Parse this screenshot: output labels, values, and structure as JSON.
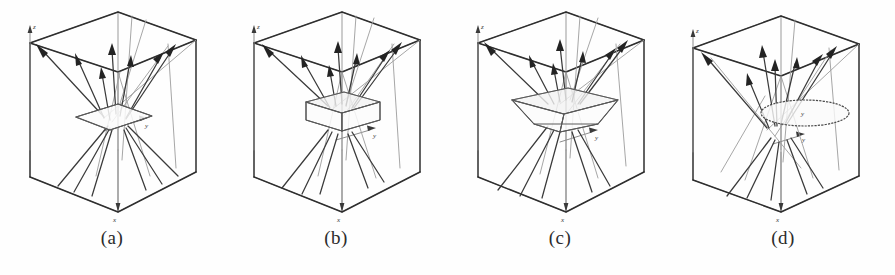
{
  "figure": {
    "background_color": "#fefefe",
    "ink_color": "#2e2e2e",
    "faint_ink_color": "#9a9a9a",
    "panel_count": 4
  },
  "axes": {
    "z_label": "z",
    "y_label": "y",
    "x_label": "x"
  },
  "panels": [
    {
      "id": "panel-a",
      "caption": "(a)",
      "scatterer": "flat-plane",
      "scatterer_name": "planar-sheet",
      "axis_z": "z",
      "axis_y": "y",
      "axis_x": "x"
    },
    {
      "id": "panel-b",
      "caption": "(b)",
      "scatterer": "rectangular-box",
      "scatterer_name": "parallelepiped",
      "axis_z": "z",
      "axis_y": "y",
      "axis_x": "x"
    },
    {
      "id": "panel-c",
      "caption": "(c)",
      "scatterer": "truncated-pyramid",
      "scatterer_name": "frustum-bowl",
      "axis_z": "z",
      "axis_y": "y",
      "axis_x": "x"
    },
    {
      "id": "panel-d",
      "caption": "(d)",
      "scatterer": "elliptical-disc",
      "scatterer_name": "circular-disc",
      "axis_z": "z",
      "axis_y": "y",
      "axis_x": "x"
    }
  ]
}
